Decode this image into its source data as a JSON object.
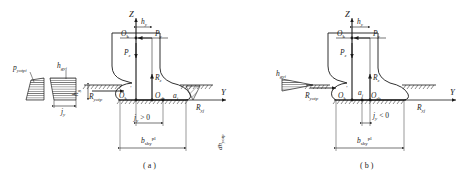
{
  "figure": {
    "panels": [
      {
        "id": "a",
        "caption": "( a )",
        "axis_z": "Z",
        "axis_y": "Y",
        "labels": {
          "h_y": "h",
          "h_y_sub": "y",
          "O_k": "O",
          "O_k_sub": "k",
          "P_y": "P",
          "P_y_sub": "y",
          "P_z": "P",
          "P_z_sub": "z",
          "R_z": "R",
          "R_z_sub": "z",
          "O_k_prime": "O",
          "O_k_prime_sub": "k",
          "O_sh": "O",
          "O_sh_sub": "sh",
          "a_j": "a",
          "a_j_sub": "j",
          "R_yotp": "R",
          "R_yotp_sub": "yotp",
          "R_yj": "R",
          "R_yj_sub": "yj",
          "h_g": "h",
          "h_g_sub": "g",
          "j_condition": "j",
          "j_condition_sub": "y",
          "j_condition_rel": " > 0",
          "b_shy": "b",
          "b_shy_sub": "shy",
          "b_shy_sup": "pl",
          "dh_side": "dh",
          "dh_side_sub": "yotp"
        },
        "stress_plot": {
          "p_yotpi": "p",
          "p_yotpi_sub": "yotpi",
          "h_gyi": "h",
          "h_gyi_sub": "gyi",
          "j_y": "j",
          "j_y_sub": "y"
        }
      },
      {
        "id": "b",
        "caption": "( b )",
        "axis_z": "Z",
        "axis_y": "Y",
        "labels": {
          "h_y": "h",
          "h_y_sub": "y",
          "O_k": "O",
          "O_k_sub": "k",
          "P_y": "P",
          "P_y_sub": "y",
          "P_z": "P",
          "P_z_sub": "z",
          "R_z": "R",
          "R_z_sub": "z",
          "O_k_prime": "O",
          "O_k_prime_sub": "k",
          "O_sh": "O",
          "O_sh_sub": "sh",
          "a_j": "a",
          "a_j_sub": "j",
          "R_yotp": "R",
          "R_yotp_sub": "yotp",
          "R_yj": "R",
          "R_yj_sub": "yj",
          "h_gyi": "h",
          "h_gyi_sub": "gyi",
          "j_condition": "j",
          "j_condition_sub": "y",
          "j_condition_rel": " < 0",
          "b_shy": "b",
          "b_shy_sub": "shy",
          "b_shy_sup": "pl"
        }
      }
    ],
    "colors": {
      "line": "#1a1a1a",
      "background": "#ffffff"
    }
  }
}
